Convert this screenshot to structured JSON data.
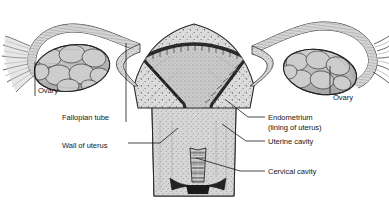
{
  "figure": {
    "style": "grayscale engraving / stipple illustration",
    "background_color": "#ffffff",
    "ink_color": "#16181a",
    "width": 389,
    "height": 202
  },
  "labels": [
    {
      "id": "ovary-left",
      "text": "Ovary",
      "x": 38,
      "y": 91,
      "leader": {
        "type": "vertical",
        "x": 35,
        "y1": 62,
        "y2": 96
      }
    },
    {
      "id": "fallopian-tube",
      "text": "Fallopian tube",
      "x": 62,
      "y": 118,
      "leader": {
        "type": "vertical",
        "x": 126,
        "y1": 43,
        "y2": 122
      }
    },
    {
      "id": "wall-of-uterus",
      "text": "Wall of uterus",
      "x": 62,
      "y": 146,
      "leader": {
        "type": "elbow",
        "x1": 128,
        "y1": 143,
        "x2": 160,
        "y2": 143,
        "x3": 178,
        "y3": 128
      }
    },
    {
      "id": "ovary-right",
      "text": "Ovary",
      "x": 333,
      "y": 98,
      "leader": {
        "type": "vertical",
        "x": 330,
        "y1": 66,
        "y2": 94
      }
    },
    {
      "id": "endometrium",
      "text": "Endometrium",
      "x": 268,
      "y": 118,
      "leader": {
        "type": "diagonal",
        "x1": 265,
        "y1": 117,
        "x2": 248,
        "y2": 117,
        "x3": 226,
        "y3": 100
      }
    },
    {
      "id": "endometrium-sub",
      "text": "(lining of uterus)",
      "x": 268,
      "y": 128,
      "leader": null
    },
    {
      "id": "uterine-cavity",
      "text": "Uterine cavity",
      "x": 268,
      "y": 142,
      "leader": {
        "type": "diagonal",
        "x1": 265,
        "y1": 141,
        "x2": 246,
        "y2": 141,
        "x3": 222,
        "y3": 124
      }
    },
    {
      "id": "cervical-cavity",
      "text": "Cervical cavity",
      "x": 268,
      "y": 172,
      "leader": {
        "type": "diagonal",
        "x1": 265,
        "y1": 171,
        "x2": 240,
        "y2": 171,
        "x3": 196,
        "y3": 158
      }
    }
  ],
  "structures": [
    {
      "id": "uterus-body",
      "name": "Uterus body (myometrium)",
      "fill": "#d9d9d9"
    },
    {
      "id": "endometrium-lining",
      "name": "Endometrium lining",
      "fill": "#4a4a4a"
    },
    {
      "id": "uterine-cavity-space",
      "name": "Uterine cavity",
      "fill": "#cfcfcf"
    },
    {
      "id": "cervix",
      "name": "Cervix",
      "fill": "#d2d2d2"
    },
    {
      "id": "cervical-canal",
      "name": "Cervical canal",
      "fill": "#c8c8c8"
    },
    {
      "id": "external-os",
      "name": "External os",
      "fill": "#2b2b2b"
    },
    {
      "id": "fallopian-tube-left",
      "name": "Left fallopian tube",
      "fill": "#d0d0d0"
    },
    {
      "id": "fallopian-tube-right",
      "name": "Right fallopian tube",
      "fill": "#d0d0d0"
    },
    {
      "id": "ovary-left-body",
      "name": "Left ovary",
      "fill": "#c6c6c6"
    },
    {
      "id": "ovary-right-body",
      "name": "Right ovary",
      "fill": "#c6c6c6"
    },
    {
      "id": "fimbriae-left",
      "name": "Left fimbriae",
      "fill": "#cccccc"
    },
    {
      "id": "fimbriae-right",
      "name": "Right fimbriae",
      "fill": "#cccccc"
    }
  ]
}
